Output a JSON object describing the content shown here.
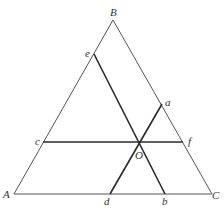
{
  "diagram": {
    "type": "ternary-triangle",
    "colors": {
      "background": "#ffffff",
      "outline": "#555555",
      "inner_lines": "#2a2a2a",
      "label": "#333333"
    },
    "vertices": {
      "A": {
        "label": "A",
        "x": 14,
        "y": 194
      },
      "B": {
        "label": "B",
        "x": 113,
        "y": 20
      },
      "C": {
        "label": "C",
        "x": 212,
        "y": 194
      }
    },
    "points": {
      "a": {
        "label": "a",
        "x": 162,
        "y": 104
      },
      "b": {
        "label": "b",
        "x": 165,
        "y": 194
      },
      "c": {
        "label": "c",
        "x": 43,
        "y": 142
      },
      "d": {
        "label": "d",
        "x": 110,
        "y": 194
      },
      "e": {
        "label": "e",
        "x": 94,
        "y": 54
      },
      "f": {
        "label": "f",
        "x": 183,
        "y": 142
      },
      "O": {
        "label": "O",
        "x": 139,
        "y": 142
      }
    },
    "segments": [
      {
        "from": "c",
        "to": "f",
        "name": "cf"
      },
      {
        "from": "e",
        "to": "b",
        "name": "eb"
      },
      {
        "from": "d",
        "to": "a",
        "name": "da"
      }
    ]
  }
}
